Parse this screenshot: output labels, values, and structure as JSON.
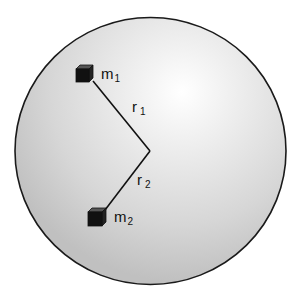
{
  "diagram": {
    "colors": {
      "background": "#ffffff",
      "sphere_fill_center": "#ffffff",
      "sphere_fill_edge": "#c4c4c4",
      "outline": "#1a1a1a",
      "mass_fill": "#111111"
    },
    "masses": [
      {
        "label": "m",
        "subscript": "1"
      },
      {
        "label": "m",
        "subscript": "2"
      }
    ],
    "vectors": [
      {
        "label": "r",
        "subscript": "1"
      },
      {
        "label": "r",
        "subscript": "2"
      }
    ]
  }
}
